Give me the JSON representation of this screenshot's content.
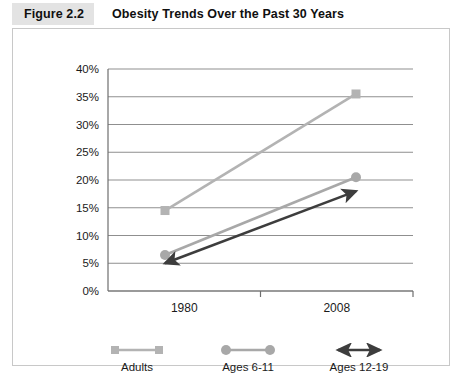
{
  "figure": {
    "tag": "Figure 2.2",
    "title": "Obesity Trends Over the Past 30 Years"
  },
  "colors": {
    "adults": "#b3b3b3",
    "ages_6_11": "#a8a8a8",
    "ages_12_19": "#3d3d3d",
    "gridline": "#8f8f8f",
    "axis": "#6e6e6e",
    "frame": "#c8c8c8",
    "tag_background": "#e3e3e3",
    "text": "#101010"
  },
  "legend": {
    "items": [
      {
        "label": "Adults",
        "marker": "square-marker",
        "color": "#b3b3b3"
      },
      {
        "label": "Ages 6-11",
        "marker": "circle-marker",
        "color": "#a8a8a8"
      },
      {
        "label": "Ages 12-19",
        "marker": "double-arrow-marker",
        "color": "#3d3d3d"
      }
    ]
  },
  "chart_data": {
    "type": "line",
    "title": "Obesity Trends Over the Past 30 Years",
    "xlabel": "",
    "ylabel": "",
    "categories": [
      "1980",
      "2008"
    ],
    "x": [
      1980,
      2008
    ],
    "ylim": [
      0,
      40
    ],
    "yticks": [
      0,
      5,
      10,
      15,
      20,
      25,
      30,
      35,
      40
    ],
    "ytick_labels": [
      "0%",
      "5%",
      "10%",
      "15%",
      "20%",
      "25%",
      "30%",
      "35%",
      "40%"
    ],
    "xtick_labels": [
      "1980",
      "2008"
    ],
    "grid": true,
    "legend_position": "bottom",
    "series": [
      {
        "name": "Adults",
        "values": [
          14.5,
          35.5
        ],
        "marker": "square",
        "color": "#b3b3b3"
      },
      {
        "name": "Ages 6-11",
        "values": [
          6.5,
          20.5
        ],
        "marker": "circle",
        "color": "#a8a8a8"
      },
      {
        "name": "Ages 12-19",
        "values": [
          5.0,
          18.0
        ],
        "marker": "arrow",
        "color": "#3d3d3d"
      }
    ]
  }
}
